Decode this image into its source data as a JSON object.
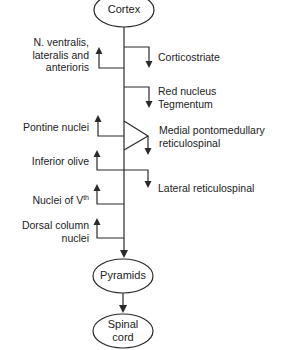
{
  "diagram": {
    "nodes": {
      "cortex": "Cortex",
      "pyramids": "Pyramids",
      "spinal_cord_line1": "Spinal",
      "spinal_cord_line2": "cord"
    },
    "left_targets": [
      {
        "lines": [
          "N. ventralis,",
          "lateralis and",
          "anterioris"
        ]
      },
      {
        "lines": [
          "Pontine nuclei"
        ]
      },
      {
        "lines": [
          "Inferior olive"
        ]
      },
      {
        "lines": [
          "Nuclei of V"
        ],
        "superscript": "th"
      },
      {
        "lines": [
          "Dorsal column",
          "nuclei"
        ]
      }
    ],
    "right_targets": [
      {
        "lines": [
          "Corticostriate"
        ]
      },
      {
        "lines": [
          "Red nucleus",
          "Tegmentum"
        ]
      },
      {
        "lines": [
          "Medial pontomedullary",
          "reticulospinal"
        ]
      },
      {
        "lines": [
          "Lateral reticulospinal"
        ]
      }
    ],
    "colors": {
      "line": "#2a2a2a",
      "background": "#ffffff",
      "text": "#222222"
    }
  }
}
